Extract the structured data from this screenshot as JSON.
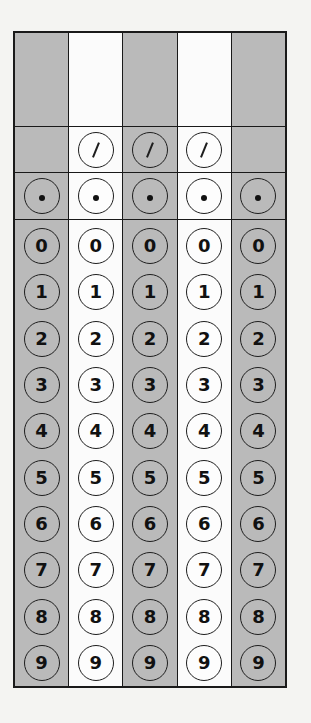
{
  "grid": {
    "columns": [
      {
        "index": 1,
        "shaded": true,
        "written_value": "",
        "has_slash": false
      },
      {
        "index": 2,
        "shaded": false,
        "written_value": "",
        "has_slash": true
      },
      {
        "index": 3,
        "shaded": true,
        "written_value": "",
        "has_slash": true
      },
      {
        "index": 4,
        "shaded": false,
        "written_value": "",
        "has_slash": true
      },
      {
        "index": 5,
        "shaded": true,
        "written_value": "",
        "has_slash": false
      }
    ],
    "slash_symbol": "/",
    "dot_symbol": ".",
    "digits": [
      "0",
      "1",
      "2",
      "3",
      "4",
      "5",
      "6",
      "7",
      "8",
      "9"
    ],
    "colors": {
      "shaded": "#bababa",
      "plain": "#fbfbfb",
      "line": "#1a1a1a",
      "background": "#f4f4f2"
    }
  }
}
